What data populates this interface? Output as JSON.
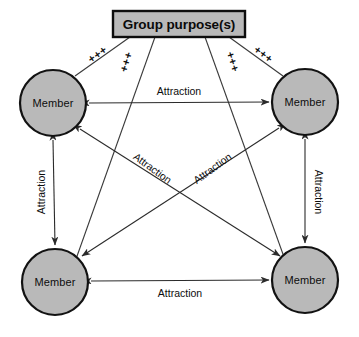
{
  "diagram": {
    "title_box": {
      "label": "Group purpose(s)",
      "fill_color": "#b9b9b9",
      "border_color": "#0d0d0d",
      "x": 113,
      "y": 11,
      "width": 132,
      "height": 26
    },
    "nodes": [
      {
        "id": "member-top-left",
        "label": "Member",
        "cx": 53,
        "cy": 103,
        "r": 33
      },
      {
        "id": "member-top-right",
        "label": "Member",
        "cx": 305,
        "cy": 102,
        "r": 33
      },
      {
        "id": "member-bottom-left",
        "label": "Member",
        "cx": 55,
        "cy": 282,
        "r": 33
      },
      {
        "id": "member-bottom-right",
        "label": "Member",
        "cx": 305,
        "cy": 280,
        "r": 33
      }
    ],
    "node_style": {
      "fill_color": "#b9b9b9",
      "border_color": "#121212"
    },
    "attraction_edges": [
      {
        "id": "top-horizontal",
        "label": "Attraction",
        "from": "member-top-left",
        "to": "member-top-right",
        "label_x": 179,
        "label_y": 92,
        "rotation": 0
      },
      {
        "id": "bottom-horizontal",
        "label": "Attraction",
        "from": "member-bottom-left",
        "to": "member-bottom-right",
        "label_x": 180,
        "label_y": 293,
        "rotation": 0
      },
      {
        "id": "left-vertical",
        "label": "Attraction",
        "from": "member-top-left",
        "to": "member-bottom-left",
        "label_x": 42,
        "label_y": 192,
        "rotation": -90
      },
      {
        "id": "right-vertical",
        "label": "Attraction",
        "from": "member-top-right",
        "to": "member-bottom-right",
        "label_x": 318,
        "label_y": 192,
        "rotation": 90
      },
      {
        "id": "diagonal-tl-br",
        "label": "Attraction",
        "from": "member-top-left",
        "to": "member-bottom-right",
        "label_x": 152,
        "label_y": 169,
        "rotation": 36
      },
      {
        "id": "diagonal-tr-bl",
        "label": "Attraction",
        "from": "member-top-right",
        "to": "member-bottom-left",
        "label_x": 213,
        "label_y": 169,
        "rotation": -36
      }
    ],
    "purpose_links": [
      {
        "id": "purpose-to-top-left",
        "label": "+++",
        "to": "member-top-left",
        "label_x": 98,
        "label_y": 55,
        "rotation": -36
      },
      {
        "id": "purpose-to-bottom-left",
        "label": "+++",
        "to": "member-bottom-left",
        "label_x": 127,
        "label_y": 62,
        "rotation": -73
      },
      {
        "id": "purpose-to-bottom-right",
        "label": "+++",
        "to": "member-bottom-right",
        "label_x": 232,
        "label_y": 62,
        "rotation": 73
      },
      {
        "id": "purpose-to-top-right",
        "label": "+++",
        "to": "member-top-right",
        "label_x": 263,
        "label_y": 55,
        "rotation": 36
      }
    ]
  }
}
